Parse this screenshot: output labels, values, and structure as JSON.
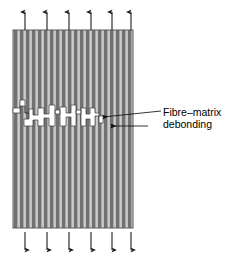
{
  "figure": {
    "annotation": {
      "line1": "Fibre–matrix",
      "line2": "debonding"
    },
    "specimen": {
      "name": "unidirectional-fibre-composite-block",
      "x": 13,
      "y": 30,
      "width": 120,
      "height": 198,
      "fibre_color": "#6e6e6e",
      "matrix_color": "#c8c8c8",
      "edge_color": "#555555",
      "stripe_pairs": 20,
      "stripe_period": 6.0,
      "fibre_width": 3.6,
      "matrix_width": 2.4
    },
    "load_arrows": {
      "color": "#222222",
      "count": 6,
      "x_positions": [
        25,
        47,
        69,
        91,
        113,
        133
      ],
      "top": {
        "name": "tensile-load-arrows-top",
        "direction": "up",
        "tail_y": 30,
        "head_y": 9
      },
      "bottom": {
        "name": "tensile-load-arrows-bottom",
        "direction": "down",
        "tail_y": 232,
        "head_y": 254
      }
    },
    "crack": {
      "name": "stepped-debonding-crack",
      "fill": "#ffffff",
      "stroke": "#2a2a2a",
      "y_center": 118,
      "x_start": 13,
      "x_end": 101
    },
    "leader_lines": [
      {
        "name": "leader-line-crack",
        "x1": 161,
        "y1": 112,
        "x2": 101,
        "y2": 117,
        "arrowhead": "left"
      },
      {
        "name": "leader-line-interface",
        "x1": 161,
        "y1": 126,
        "x2": 110,
        "y2": 126,
        "arrowhead": "left"
      }
    ]
  }
}
